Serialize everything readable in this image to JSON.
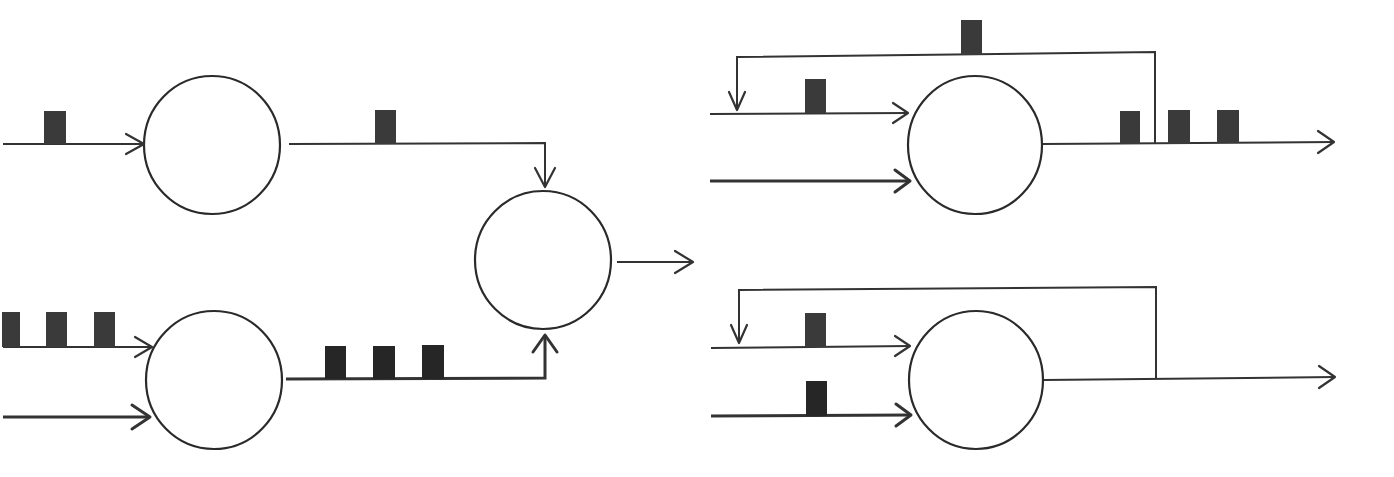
{
  "diagram": {
    "type": "spiking-neuron-network",
    "colors": {
      "background": "#ffffff",
      "stroke": "#333333",
      "spike": "#3a3a3a"
    },
    "panels": [
      {
        "id": "left-network",
        "neurons": [
          {
            "id": "n1",
            "cx": 212,
            "cy": 145,
            "rx": 68,
            "ry": 69
          },
          {
            "id": "n2",
            "cx": 214,
            "cy": 380,
            "rx": 68,
            "ry": 69
          },
          {
            "id": "n3",
            "cx": 543,
            "cy": 260,
            "rx": 68,
            "ry": 69
          }
        ],
        "connections": [
          {
            "id": "in-n1",
            "from": "input",
            "to": "n1",
            "spikes": 1
          },
          {
            "id": "in-n2-a",
            "from": "input",
            "to": "n2",
            "spikes": 3
          },
          {
            "id": "in-n2-b",
            "from": "input",
            "to": "n2",
            "spikes": 0
          },
          {
            "id": "n1-n3",
            "from": "n1",
            "to": "n3",
            "spikes": 1
          },
          {
            "id": "n2-n3",
            "from": "n2",
            "to": "n3",
            "spikes": 3
          },
          {
            "id": "n3-out",
            "from": "n3",
            "to": "output",
            "spikes": 0
          }
        ]
      },
      {
        "id": "right-top-recurrent",
        "neurons": [
          {
            "id": "n4",
            "cx": 975,
            "cy": 145,
            "rx": 68,
            "ry": 69
          }
        ],
        "connections": [
          {
            "id": "in-n4-a",
            "from": "input",
            "to": "n4",
            "spikes": 1
          },
          {
            "id": "in-n4-b",
            "from": "input",
            "to": "n4",
            "spikes": 0
          },
          {
            "id": "n4-feedback",
            "from": "n4",
            "to": "n4",
            "spikes": 1
          },
          {
            "id": "n4-out",
            "from": "n4",
            "to": "output",
            "spikes": 3
          }
        ]
      },
      {
        "id": "right-bottom-recurrent",
        "neurons": [
          {
            "id": "n5",
            "cx": 976,
            "cy": 380,
            "rx": 68,
            "ry": 69
          }
        ],
        "connections": [
          {
            "id": "in-n5-a",
            "from": "input",
            "to": "n5",
            "spikes": 1
          },
          {
            "id": "in-n5-b",
            "from": "input",
            "to": "n5",
            "spikes": 1
          },
          {
            "id": "n5-feedback",
            "from": "n5",
            "to": "n5",
            "spikes": 0
          },
          {
            "id": "n5-out",
            "from": "n5",
            "to": "output",
            "spikes": 0
          }
        ]
      }
    ]
  }
}
